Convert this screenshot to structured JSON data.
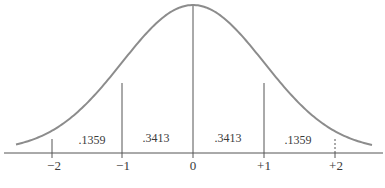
{
  "figure": {
    "type": "normal-distribution-diagram",
    "curve_color": "#8c8c8c",
    "line_color": "#555555",
    "x_ticks": [
      {
        "label": "−2",
        "x": 52
      },
      {
        "label": "−1",
        "x": 122
      },
      {
        "label": "0",
        "x": 193
      },
      {
        "label": "+1",
        "x": 264
      },
      {
        "label": "+2",
        "x": 335
      }
    ],
    "areas": [
      {
        "label": ".1359",
        "x": 92
      },
      {
        "label": ".3413",
        "x": 156
      },
      {
        "label": ".3413",
        "x": 228
      },
      {
        "label": ".1359",
        "x": 298
      }
    ],
    "caption": "… … … … …"
  }
}
